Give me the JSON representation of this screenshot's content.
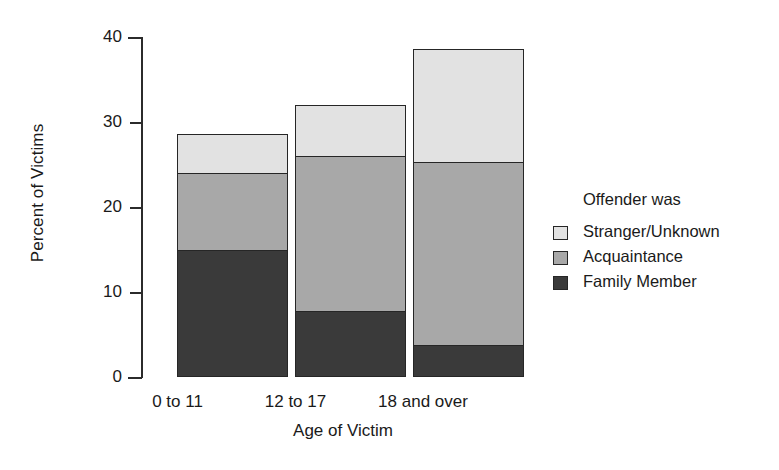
{
  "chart_data": {
    "type": "bar",
    "stacked": true,
    "title": "",
    "xlabel": "Age of Victim",
    "ylabel": "Percent of Victims",
    "categories": [
      "0 to 11",
      "12 to 17",
      "18 and over"
    ],
    "ylim": [
      0,
      40
    ],
    "yticks": [
      0,
      10,
      20,
      30,
      40
    ],
    "ytick_labels": [
      "0",
      "10",
      "20",
      "30",
      "40"
    ],
    "grid": false,
    "legend_position": "right",
    "legend_title": "Offender was",
    "series": [
      {
        "name": "Family Member",
        "values": [
          14.9,
          7.8,
          3.8
        ],
        "color": "#3a3a3a"
      },
      {
        "name": "Acquaintance",
        "values": [
          9.3,
          18.4,
          21.7
        ],
        "color": "#a8a8a8"
      },
      {
        "name": "Stranger/Unknown",
        "values": [
          4.8,
          6.1,
          13.5
        ],
        "color": "#e2e2e2"
      }
    ],
    "totals": [
      29.0,
      32.3,
      39.0
    ],
    "legend_order": [
      "Stranger/Unknown",
      "Acquaintance",
      "Family Member"
    ]
  },
  "axis": {
    "y_title": "Percent of Victims",
    "x_title": "Age of Victim",
    "y_labels": [
      "40",
      "30",
      "20",
      "10",
      "0"
    ],
    "x_labels": [
      "0 to 11",
      "12 to 17",
      "18 and over"
    ]
  },
  "legend": {
    "title": "Offender was",
    "items": [
      {
        "label": "Stranger/Unknown",
        "color": "#e2e2e2"
      },
      {
        "label": "Acquaintance",
        "color": "#a8a8a8"
      },
      {
        "label": "Family Member",
        "color": "#3a3a3a"
      }
    ]
  }
}
